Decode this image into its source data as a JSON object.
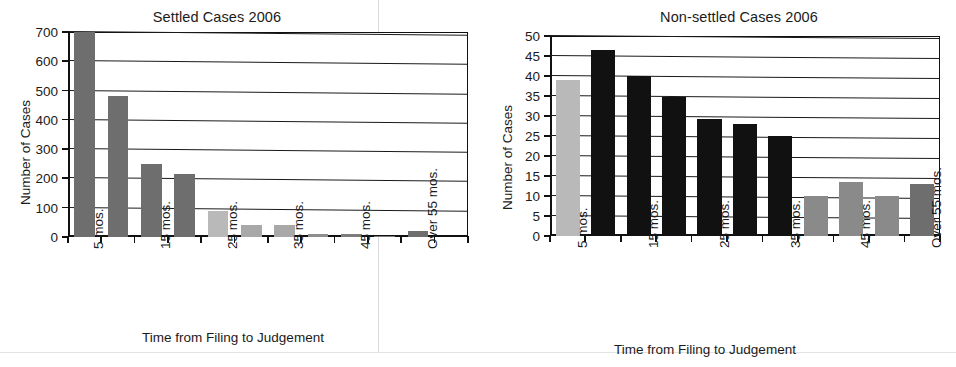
{
  "charts": [
    {
      "key": "settled",
      "title": "Settled Cases 2006",
      "ylabel": "Number of Cases",
      "xlabel": "Time from Filing to Judgement",
      "yticks": [
        "0",
        "100",
        "200",
        "300",
        "400",
        "500",
        "600",
        "700"
      ],
      "xticklabels": [
        "5 mos.",
        "15 mos.",
        "25 mos.",
        "35 mos.",
        "45 mos.",
        "Over 55 mos."
      ]
    },
    {
      "key": "nonsettled",
      "title": "Non-settled Cases 2006",
      "ylabel": "Number of Cases",
      "xlabel": "Time from Filing to Judgement",
      "yticks": [
        "0",
        "5",
        "10",
        "15",
        "20",
        "25",
        "30",
        "35",
        "40",
        "45",
        "50"
      ],
      "xticklabels": [
        "5 mos.",
        "15 mos.",
        "25 mos.",
        "35 mos.",
        "45 mos.",
        "Over 55 mos."
      ]
    }
  ],
  "chart_data": [
    {
      "type": "bar",
      "title": "Settled Cases 2006",
      "xlabel": "Time from Filing to Judgement",
      "ylabel": "Number of Cases",
      "ylim": [
        0,
        700
      ],
      "ytick_step": 100,
      "grid": true,
      "legend": "none",
      "categories": [
        "5 mos.",
        "10 mos.",
        "15 mos.",
        "20 mos.",
        "25 mos.",
        "30 mos.",
        "35 mos.",
        "40 mos.",
        "45 mos.",
        "50 mos.",
        "55 mos.",
        "Over 55 mos."
      ],
      "tick_labels_shown": [
        "5 mos.",
        "",
        "15 mos.",
        "",
        "25 mos.",
        "",
        "35 mos.",
        "",
        "45 mos.",
        "",
        "Over 55 mos.",
        ""
      ],
      "values": [
        700,
        480,
        250,
        215,
        90,
        40,
        40,
        12,
        10,
        5,
        20,
        0
      ],
      "bar_colors": [
        "#6e6e6e",
        "#6e6e6e",
        "#6e6e6e",
        "#6e6e6e",
        "#b9b9b9",
        "#a8a8a8",
        "#a8a8a8",
        "#8e8e8e",
        "#7d7d7d",
        "#7d7d7d",
        "#6e6e6e",
        "#ffffff"
      ],
      "notes": "First bar is clipped at the 700 top of the plot frame."
    },
    {
      "type": "bar",
      "title": "Non-settled Cases 2006",
      "xlabel": "Time from Filing to Judgement",
      "ylabel": "Number of Cases",
      "ylim": [
        0,
        50
      ],
      "ytick_step": 5,
      "grid": true,
      "legend": "none",
      "categories": [
        "5 mos.",
        "10 mos.",
        "15 mos.",
        "20 mos.",
        "25 mos.",
        "30 mos.",
        "35 mos.",
        "40 mos.",
        "45 mos.",
        "50 mos.",
        "Over 55 mos."
      ],
      "tick_labels_shown": [
        "5 mos.",
        "",
        "15 mos.",
        "",
        "25 mos.",
        "",
        "35 mos.",
        "",
        "45 mos.",
        "",
        "Over 55 mos."
      ],
      "values": [
        39,
        46.5,
        40,
        34.7,
        29.3,
        28,
        25,
        10,
        13.5,
        10,
        13
      ],
      "bar_colors": [
        "#b9b9b9",
        "#111111",
        "#111111",
        "#111111",
        "#111111",
        "#111111",
        "#111111",
        "#8a8a8a",
        "#8a8a8a",
        "#8a8a8a",
        "#6e6e6e"
      ]
    }
  ]
}
